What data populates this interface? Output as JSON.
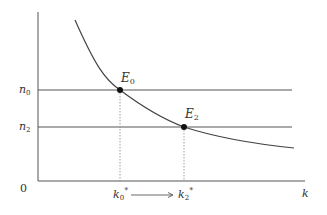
{
  "diagram": {
    "type": "economic-growth-diagram",
    "origin_label": "0",
    "x_axis_label": "k",
    "y_axis_labels": [
      {
        "id": "n0",
        "base": "n",
        "sub": "0"
      },
      {
        "id": "n2",
        "base": "n",
        "sub": "2"
      }
    ],
    "points": [
      {
        "id": "E0",
        "base": "E",
        "sub": "0"
      },
      {
        "id": "E2",
        "base": "E",
        "sub": "2"
      }
    ],
    "x_ticks": [
      {
        "id": "k0star",
        "base": "k",
        "sub": "0",
        "sup": "*"
      },
      {
        "id": "k2star",
        "base": "k",
        "sub": "2",
        "sup": "*"
      }
    ],
    "transition_arrow": {
      "from": "k0star",
      "to": "k2star"
    },
    "colors": {
      "axis": "#555555",
      "curve": "#444444",
      "horizontal_lines": "#555555",
      "dotted": "#888888",
      "points": "#111111"
    }
  }
}
